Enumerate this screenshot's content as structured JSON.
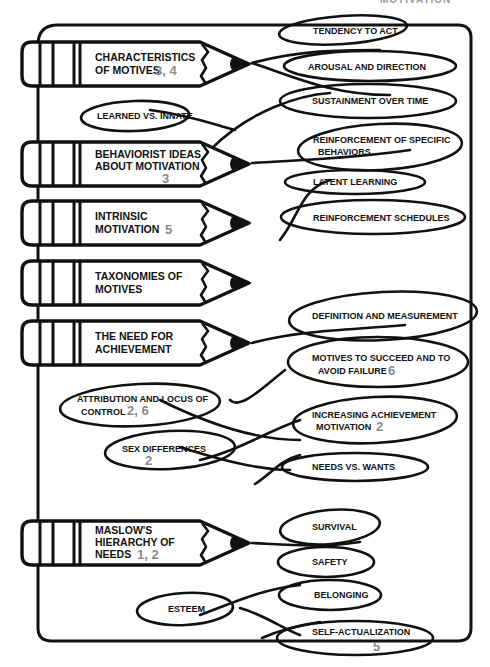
{
  "header": {
    "title": "MOTIVATION"
  },
  "colors": {
    "ink": "#111111",
    "number_gray": "#8a8a8a",
    "background": "#ffffff"
  },
  "topics": [
    {
      "line1": "CHARACTERISTICS",
      "line2": "OF MOTIVES",
      "line3": "",
      "chapters": "3, 4",
      "subtopics": [
        {
          "line1": "TENDENCY TO ACT",
          "line2": "",
          "chapters": ""
        },
        {
          "line1": "AROUSAL AND DIRECTION",
          "line2": "",
          "chapters": ""
        },
        {
          "line1": "SUSTAINMENT OVER TIME",
          "line2": "",
          "chapters": ""
        },
        {
          "line1": "LEARNED VS. INNATE",
          "line2": "",
          "chapters": ""
        }
      ]
    },
    {
      "line1": "BEHAVIORIST IDEAS",
      "line2": "ABOUT MOTIVATION",
      "line3": "",
      "chapters": "3",
      "subtopics": [
        {
          "line1": "REINFORCEMENT OF SPECIFIC",
          "line2": "BEHAVIORS",
          "chapters": ""
        },
        {
          "line1": "LATENT LEARNING",
          "line2": "",
          "chapters": ""
        },
        {
          "line1": "REINFORCEMENT SCHEDULES",
          "line2": "",
          "chapters": ""
        }
      ]
    },
    {
      "line1": "INTRINSIC",
      "line2": "MOTIVATION",
      "line3": "",
      "chapters": "5",
      "subtopics": []
    },
    {
      "line1": "TAXONOMIES OF",
      "line2": "MOTIVES",
      "line3": "",
      "chapters": "",
      "subtopics": []
    },
    {
      "line1": "THE NEED FOR",
      "line2": "ACHIEVEMENT",
      "line3": "",
      "chapters": "",
      "subtopics": [
        {
          "line1": "DEFINITION AND MEASUREMENT",
          "line2": "",
          "chapters": ""
        },
        {
          "line1": "MOTIVES TO SUCCEED AND TO",
          "line2": "AVOID FAILURE",
          "chapters": "6"
        },
        {
          "line1": "ATTRIBUTION AND LOCUS OF",
          "line2": "CONTROL",
          "chapters": "2, 6"
        },
        {
          "line1": "INCREASING ACHIEVEMENT",
          "line2": "MOTIVATION",
          "chapters": "2"
        },
        {
          "line1": "SEX DIFFERENCES",
          "line2": "",
          "chapters": "2"
        },
        {
          "line1": "NEEDS VS. WANTS",
          "line2": "",
          "chapters": ""
        }
      ]
    },
    {
      "line1": "MASLOW'S",
      "line2": "HIERARCHY OF",
      "line3": "NEEDS",
      "chapters": "1, 2",
      "subtopics": [
        {
          "line1": "SURVIVAL",
          "line2": "",
          "chapters": ""
        },
        {
          "line1": "SAFETY",
          "line2": "",
          "chapters": ""
        },
        {
          "line1": "BELONGING",
          "line2": "",
          "chapters": ""
        },
        {
          "line1": "ESTEEM",
          "line2": "",
          "chapters": ""
        },
        {
          "line1": "SELF-ACTUALIZATION",
          "line2": "",
          "chapters": "5"
        }
      ]
    }
  ]
}
